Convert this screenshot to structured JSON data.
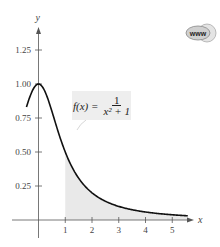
{
  "chart_data": {
    "type": "area",
    "title": "",
    "function_label": {
      "lhs": "f(x) =",
      "numerator": "1",
      "denominator": "x² + 1"
    },
    "xlabel": "x",
    "ylabel": "y",
    "x_ticks": [
      1,
      2,
      3,
      4,
      5
    ],
    "x_tick_labels": [
      "1",
      "2",
      "3",
      "4",
      "5"
    ],
    "y_ticks": [
      0.25,
      0.5,
      0.75,
      1.0,
      1.25
    ],
    "y_tick_labels": [
      "0.25",
      "0.50",
      "0.75",
      "1.00",
      "1.25"
    ],
    "xlim": [
      -0.6,
      6.0
    ],
    "ylim": [
      0,
      1.45
    ],
    "grid": false,
    "curve": {
      "formula": "1/(x^2+1)",
      "x_range": [
        -0.45,
        5.6
      ]
    },
    "series": [
      {
        "name": "f(x)",
        "x": [
          -0.45,
          -0.25,
          0,
          0.25,
          0.5,
          1,
          1.5,
          2,
          2.5,
          3,
          3.5,
          4,
          4.5,
          5,
          5.5
        ],
        "values": [
          0.83,
          0.94,
          1.0,
          0.94,
          0.8,
          0.5,
          0.31,
          0.2,
          0.14,
          0.1,
          0.08,
          0.06,
          0.05,
          0.04,
          0.03
        ]
      }
    ],
    "shaded_region": {
      "from_x": 1,
      "to_x": 5.6,
      "description": "area under f(x) for x >= 1"
    }
  },
  "icon": {
    "name": "www-globe-icon",
    "label": "www"
  },
  "colors": {
    "curve": "#111111",
    "shade": "#e9e9e9",
    "axis": "#555555",
    "label_box": "#eeeeee"
  }
}
